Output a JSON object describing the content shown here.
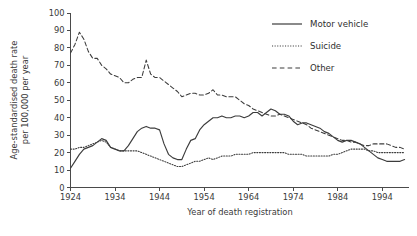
{
  "chart_data": {
    "type": "line",
    "title": "",
    "xlabel": "Year of death registration",
    "ylabel": "Age-standardised death rate per 100,000 per year",
    "ylabel_line1": "Age-standardised death rate",
    "ylabel_line2": "per 100,000 per year",
    "xlim": [
      1924,
      2000
    ],
    "ylim": [
      0,
      100
    ],
    "ytick_step": 10,
    "xtick_step": 10,
    "grid": false,
    "legend_position": "top-right",
    "ytick_labels": [
      "0",
      "10",
      "20",
      "30",
      "40",
      "50",
      "60",
      "70",
      "80",
      "90",
      "100"
    ],
    "ytick_values": [
      0,
      10,
      20,
      30,
      40,
      50,
      60,
      70,
      80,
      90,
      100
    ],
    "xtick_labels": [
      "1924",
      "1934",
      "1944",
      "1954",
      "1964",
      "1974",
      "1984",
      "1994"
    ],
    "xtick_values": [
      1924,
      1934,
      1944,
      1954,
      1964,
      1974,
      1984,
      1994
    ],
    "x": [
      1924,
      1925,
      1926,
      1927,
      1928,
      1929,
      1930,
      1931,
      1932,
      1933,
      1934,
      1935,
      1936,
      1937,
      1938,
      1939,
      1940,
      1941,
      1942,
      1943,
      1944,
      1945,
      1946,
      1947,
      1948,
      1949,
      1950,
      1951,
      1952,
      1953,
      1954,
      1955,
      1956,
      1957,
      1958,
      1959,
      1960,
      1961,
      1962,
      1963,
      1964,
      1965,
      1966,
      1967,
      1968,
      1969,
      1970,
      1971,
      1972,
      1973,
      1974,
      1975,
      1976,
      1977,
      1978,
      1979,
      1980,
      1981,
      1982,
      1983,
      1984,
      1985,
      1986,
      1987,
      1988,
      1989,
      1990,
      1991,
      1992,
      1993,
      1994,
      1995,
      1996,
      1997,
      1998,
      1999
    ],
    "series": [
      {
        "name": "Motor vehicle",
        "style": "solid",
        "values": [
          11,
          15,
          19,
          22,
          23,
          24,
          26,
          28,
          27,
          23,
          22,
          21,
          21,
          24,
          28,
          32,
          34,
          35,
          34,
          34,
          33,
          25,
          19,
          17,
          16,
          16,
          22,
          27,
          28,
          33,
          36,
          38,
          40,
          40,
          41,
          40,
          40,
          41,
          41,
          40,
          41,
          43,
          43,
          41,
          43,
          45,
          44,
          42,
          42,
          41,
          38,
          36,
          37,
          37,
          36,
          35,
          34,
          32,
          31,
          29,
          27,
          26,
          27,
          27,
          26,
          25,
          23,
          21,
          19,
          17,
          16,
          15,
          15,
          15,
          15,
          16
        ]
      },
      {
        "name": "Suicide",
        "style": "dotted",
        "values": [
          22,
          22,
          23,
          23,
          24,
          25,
          26,
          27,
          26,
          23,
          22,
          21,
          21,
          21,
          21,
          21,
          20,
          19,
          18,
          17,
          16,
          15,
          14,
          13,
          12,
          12,
          13,
          14,
          15,
          15,
          16,
          17,
          16,
          17,
          18,
          18,
          18,
          19,
          19,
          19,
          19,
          20,
          20,
          20,
          20,
          20,
          20,
          20,
          20,
          19,
          19,
          19,
          19,
          18,
          18,
          18,
          18,
          18,
          18,
          19,
          19,
          20,
          21,
          22,
          22,
          22,
          22,
          21,
          21,
          20,
          20,
          20,
          20,
          20,
          20,
          20
        ]
      },
      {
        "name": "Other",
        "style": "dashed",
        "values": [
          77,
          82,
          89,
          85,
          78,
          74,
          74,
          70,
          68,
          65,
          64,
          63,
          60,
          60,
          62,
          63,
          63,
          73,
          65,
          63,
          63,
          61,
          59,
          57,
          55,
          52,
          53,
          54,
          54,
          53,
          53,
          54,
          56,
          53,
          53,
          52,
          52,
          52,
          50,
          48,
          47,
          45,
          44,
          43,
          42,
          41,
          41,
          42,
          41,
          40,
          39,
          38,
          37,
          36,
          34,
          33,
          32,
          31,
          30,
          29,
          28,
          27,
          27,
          26,
          26,
          25,
          24,
          24,
          25,
          25,
          25,
          25,
          24,
          23,
          23,
          22
        ]
      }
    ]
  },
  "legend": {
    "items": [
      {
        "label": "Motor vehicle",
        "style": "solid"
      },
      {
        "label": "Suicide",
        "style": "dotted"
      },
      {
        "label": "Other",
        "style": "dashed"
      }
    ]
  }
}
